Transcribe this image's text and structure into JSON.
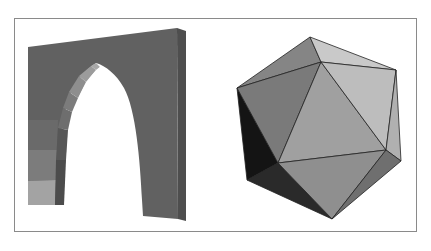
{
  "figure": {
    "panels": [
      {
        "id": "arch",
        "label": "3D pointed (Gothic) arch",
        "colors": {
          "front": "#616161",
          "side": "#4e4e4e",
          "intrados_light": "#8e8e8e",
          "intrados_mid": "#7a7a7a",
          "voussoir_lightest": "#a8a8a8",
          "voussoir_light": "#909090",
          "voussoir_mid": "#7c7c7c",
          "voussoir_dark": "#6c6c6c"
        }
      },
      {
        "id": "icosahedron",
        "label": "Shaded icosahedron",
        "colors": {
          "top_left": "#858585",
          "top_right": "#c8c8c8",
          "left": "#7a7a7a",
          "center": "#a0a0a0",
          "right": "#bdbdbd",
          "right_edge": "#b0b0b0",
          "bottom": "#8f8f8f",
          "bottom_right": "#6f6f6f",
          "shadow_left": "#141414",
          "shadow_bottom": "#2a2a2a",
          "edge": "#222222"
        }
      }
    ],
    "frame_color": "#8a8a8a",
    "background": "#ffffff"
  }
}
